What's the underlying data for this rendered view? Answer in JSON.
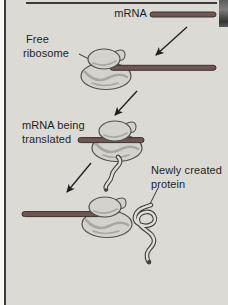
{
  "figure": {
    "labels": {
      "mrna": "mRNA",
      "free_ribosome_line1": "Free",
      "free_ribosome_line2": "ribosome",
      "translated_line1": "mRNA being",
      "translated_line2": "translated",
      "protein_line1": "Newly created",
      "protein_line2": "protein"
    },
    "colors": {
      "background": "#dbdad5",
      "text": "#1e1e1e",
      "arrow": "#1e1e1e",
      "border_line": "#3a3a3a",
      "mrna_rod": "#6f5650",
      "mrna_rod_outline": "#3c3230",
      "ribosome_fill": "#d3d2cc",
      "ribosome_shade": "#a8a7a0",
      "ribosome_outline": "#54524e",
      "protein_outline": "#44423e",
      "protein_fill": "#deddd7"
    }
  }
}
